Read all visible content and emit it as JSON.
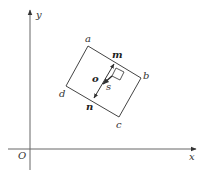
{
  "diagram": {
    "type": "geometry",
    "axes": {
      "x_label": "x",
      "y_label": "y",
      "origin_label": "O"
    },
    "rectangle": {
      "vertices": [
        "a",
        "b",
        "c",
        "d"
      ]
    },
    "vectors": {
      "m": "m",
      "n": "n",
      "o": "o",
      "s": "s"
    },
    "colors": {
      "line": "#444444",
      "background": "#ffffff"
    }
  }
}
